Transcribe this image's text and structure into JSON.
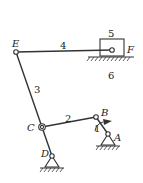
{
  "diagram": {
    "type": "planar-six-bar-linkage",
    "joints": {
      "A": {
        "label": "A",
        "x": 108,
        "y": 134,
        "kind": "fixed-pivot"
      },
      "B": {
        "label": "B",
        "x": 96,
        "y": 117,
        "kind": "revolute"
      },
      "C": {
        "label": "C",
        "x": 42,
        "y": 127,
        "kind": "revolute"
      },
      "D": {
        "label": "D",
        "x": 52,
        "y": 156,
        "kind": "fixed-pivot"
      },
      "E": {
        "label": "E",
        "x": 16,
        "y": 52,
        "kind": "revolute"
      },
      "F": {
        "label": "F",
        "x": 112,
        "y": 50,
        "kind": "revolute"
      }
    },
    "links": [
      {
        "number": "1",
        "from": "A",
        "to": "B",
        "role": "crank"
      },
      {
        "number": "2",
        "from": "B",
        "to": "C",
        "role": "coupler"
      },
      {
        "number": "3",
        "from": "D",
        "to": "E",
        "role": "rocker"
      },
      {
        "number": "4",
        "from": "E",
        "to": "F",
        "role": "connecting-rod"
      },
      {
        "number": "5",
        "role": "slider"
      },
      {
        "number": "6",
        "role": "frame-guide"
      }
    ],
    "labels": {
      "E": "E",
      "F": "F",
      "C": "C",
      "D": "D",
      "B": "B",
      "A": "A",
      "n1": "1",
      "n2": "2",
      "n3": "3",
      "n4": "4",
      "n5": "5",
      "n6": "6"
    },
    "rotation_indicator": {
      "at": "B",
      "direction": "arrow on crank 1"
    }
  }
}
